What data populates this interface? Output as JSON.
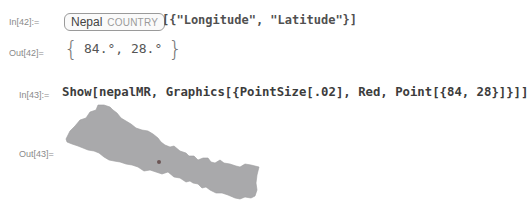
{
  "cells": [
    {
      "in_label": "In[42]:=",
      "entity": {
        "name": "Nepal",
        "type": "COUNTRY"
      },
      "code_rest": "[{\"Longitude\", \"Latitude\"}]"
    },
    {
      "out_label": "Out[42]=",
      "output": {
        "open": "{",
        "items_text": "84.°, 28.°",
        "close": "}"
      }
    },
    {
      "in_label": "In[43]:=",
      "code": "Show[nepalMR, Graphics[{PointSize[.02], Red, Point[{84, 28}]}]]"
    },
    {
      "out_label": "Out[43]=",
      "graphic": {
        "description": "map of Nepal with point",
        "fill_color": "#a9a9ab",
        "point_color": "#555555"
      }
    }
  ]
}
